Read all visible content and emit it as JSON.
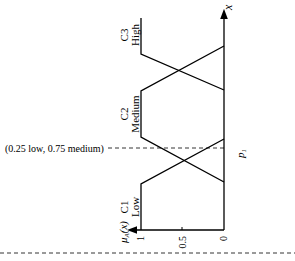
{
  "diagram": {
    "type": "fuzzy-membership-functions",
    "orientation": "rotated-90-ccw",
    "x_axis_label": "x",
    "y_axis_label": "μA(x)",
    "y_ticks": [
      "1",
      "0.5",
      "0"
    ],
    "sets": [
      {
        "id": "C1",
        "name": "Low"
      },
      {
        "id": "C2",
        "name": "Medium"
      },
      {
        "id": "C3",
        "name": "High"
      }
    ],
    "marker_label": "p1",
    "annotation": "(0.25 low, 0.75 medium)",
    "colors": {
      "line": "#000000",
      "background": "#ffffff"
    }
  }
}
